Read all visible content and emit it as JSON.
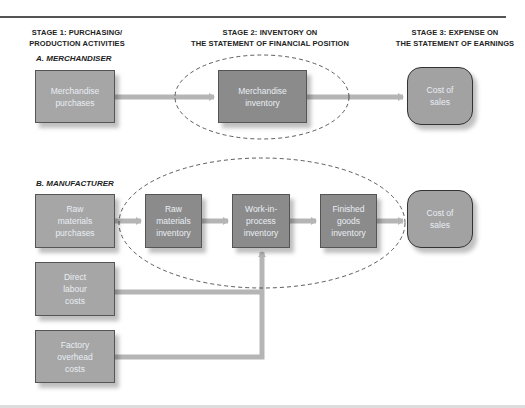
{
  "headers": {
    "stage1": [
      "STAGE 1: PURCHASING/",
      "PRODUCTION ACTIVITIES"
    ],
    "stage2": [
      "STAGE 2: INVENTORY ON",
      "THE STATEMENT OF FINANCIAL POSITION"
    ],
    "stage3": [
      "STAGE 3: EXPENSE ON",
      "THE STATEMENT OF EARNINGS"
    ]
  },
  "merchandiser": {
    "title": "A. MERCHANDISER",
    "purchases": [
      "Merchandise",
      "purchases"
    ],
    "inventory": [
      "Merchandise",
      "inventory"
    ],
    "cost_of_sales": [
      "Cost of",
      "sales"
    ]
  },
  "manufacturer": {
    "title": "B. MANUFACTURER",
    "raw_purchases": [
      "Raw",
      "materials",
      "purchases"
    ],
    "raw_inventory": [
      "Raw",
      "materials",
      "inventory"
    ],
    "wip_inventory": [
      "Work-in-",
      "process",
      "inventory"
    ],
    "fg_inventory": [
      "Finished",
      "goods",
      "inventory"
    ],
    "cost_of_sales": [
      "Cost of",
      "sales"
    ],
    "direct_labour": [
      "Direct",
      "labour",
      "costs"
    ],
    "factory_overhead": [
      "Factory",
      "overhead",
      "costs"
    ]
  },
  "colors": {
    "light_box": "#a6a6a6",
    "dark_box": "#8b8b8b",
    "arrow": "#b5b5b5",
    "text_on_box": "#e9eef4"
  }
}
